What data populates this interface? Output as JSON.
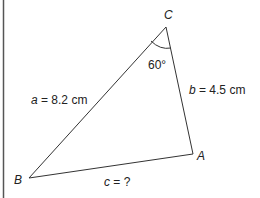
{
  "diagram": {
    "type": "triangle",
    "vertices": {
      "A": {
        "label": "A"
      },
      "B": {
        "label": "B"
      },
      "C": {
        "label": "C"
      }
    },
    "sides": {
      "a": {
        "var": "a",
        "text": " = 8.2 cm"
      },
      "b": {
        "var": "b",
        "text": " = 4.5 cm"
      },
      "c": {
        "var": "c",
        "text": " = ?"
      }
    },
    "angle_C": {
      "label": "60°"
    },
    "colors": {
      "stroke": "#333333",
      "text": "#222222",
      "border": "#555555"
    }
  }
}
